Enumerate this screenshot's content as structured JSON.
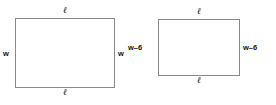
{
  "diagram": {
    "background_color": "#ffffff",
    "stroke_color": "#8a8a8a",
    "text_color": "#121212",
    "figures": [
      {
        "id": "rect-left",
        "name": "original-rectangle",
        "labels": {
          "top": "ℓ",
          "bottom": "ℓ",
          "left": "w",
          "right": "w"
        }
      },
      {
        "id": "rect-right",
        "name": "reduced-rectangle",
        "labels": {
          "top": "ℓ",
          "bottom": "ℓ",
          "left": "w–6",
          "right": "w–6"
        }
      }
    ]
  }
}
